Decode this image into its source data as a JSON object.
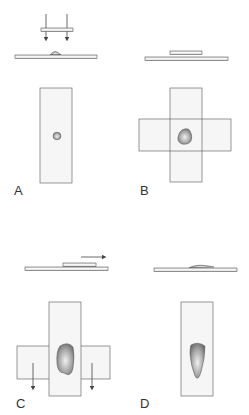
{
  "figure": {
    "panels": [
      {
        "id": "A",
        "label": "A",
        "description": "Coverslip lowered vertically onto drop on slide; top view shows small drop"
      },
      {
        "id": "B",
        "label": "B",
        "description": "Coverslip placed crosswise on slide; drop spreads between them"
      },
      {
        "id": "C",
        "label": "C",
        "description": "Coverslip pulled horizontally; side pieces pulled downward to smear"
      },
      {
        "id": "D",
        "label": "D",
        "description": "Resulting smear on slide, elongated"
      }
    ],
    "colors": {
      "stroke": "#555555",
      "slide_fill": "#f4f4f4",
      "specimen_dark": "#7a7a7a",
      "specimen_light": "#e8e8e8"
    }
  }
}
